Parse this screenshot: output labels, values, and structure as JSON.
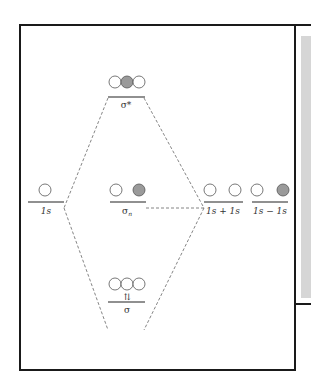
{
  "diagram": {
    "type": "molecular-orbital-energy-diagram",
    "colors": {
      "frame": "#1a1a1a",
      "line": "#333333",
      "dashed": "#666666",
      "orbital_outline": "#555555",
      "orbital_filled": "#9a9a9a",
      "side_panel": "#d6d6d6"
    },
    "levels": {
      "sigma_star": {
        "label": "σ*",
        "orbitals": [
          "empty",
          "filled",
          "empty"
        ]
      },
      "left_1s": {
        "label": "1s",
        "orbitals": [
          "empty"
        ]
      },
      "sigma_n": {
        "label": "σn",
        "label_base": "σ",
        "label_sub": "n",
        "orbitals": [
          "empty",
          "filled"
        ]
      },
      "combo_plus": {
        "label": "1s + 1s",
        "orbitals": [
          "empty",
          "empty"
        ]
      },
      "combo_minus": {
        "label": "1s − 1s",
        "orbitals": [
          "empty",
          "filled"
        ]
      },
      "sigma": {
        "label": "σ",
        "electrons": "⇅",
        "orbitals": [
          "empty",
          "empty",
          "empty"
        ]
      }
    }
  }
}
